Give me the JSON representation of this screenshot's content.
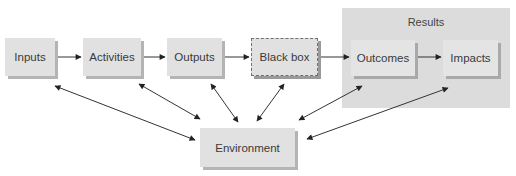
{
  "diagram": {
    "results_group": {
      "label": "Results"
    },
    "nodes": {
      "inputs": {
        "label": "Inputs"
      },
      "activities": {
        "label": "Activities"
      },
      "outputs": {
        "label": "Outputs"
      },
      "black_box": {
        "label": "Black box"
      },
      "outcomes": {
        "label": "Outcomes"
      },
      "impacts": {
        "label": "Impacts"
      },
      "environment": {
        "label": "Environment"
      }
    },
    "edges": [
      {
        "from": "Inputs",
        "to": "Activities",
        "type": "directed"
      },
      {
        "from": "Activities",
        "to": "Outputs",
        "type": "directed"
      },
      {
        "from": "Outputs",
        "to": "Black box",
        "type": "directed"
      },
      {
        "from": "Black box",
        "to": "Outcomes",
        "type": "directed"
      },
      {
        "from": "Outcomes",
        "to": "Impacts",
        "type": "directed"
      },
      {
        "from": "Environment",
        "to": "Inputs",
        "type": "bidirectional"
      },
      {
        "from": "Environment",
        "to": "Activities",
        "type": "bidirectional"
      },
      {
        "from": "Environment",
        "to": "Outputs",
        "type": "bidirectional"
      },
      {
        "from": "Environment",
        "to": "Black box",
        "type": "bidirectional"
      },
      {
        "from": "Environment",
        "to": "Outcomes",
        "type": "bidirectional"
      },
      {
        "from": "Environment",
        "to": "Impacts",
        "type": "bidirectional"
      }
    ],
    "colors": {
      "node_fill": "#e1e1e1",
      "results_fill": "#dcdcdc",
      "shadow": "#b4b4b4",
      "arrow": "#222222"
    }
  }
}
